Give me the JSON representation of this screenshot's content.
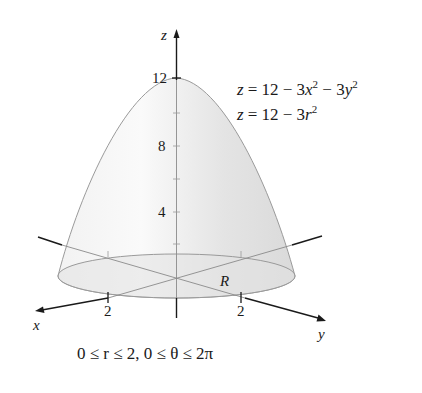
{
  "figure": {
    "equations": {
      "cartesian": {
        "lhs": "z",
        "rhs_prefix": "= 12 − 3",
        "x_var": "x",
        "mid": " − 3",
        "y_var": "y",
        "exp": "2"
      },
      "polar": {
        "lhs": "z",
        "rhs_prefix": "= 12 − 3",
        "r_var": "r",
        "exp": "2"
      }
    },
    "axes": {
      "z_label": "z",
      "x_label": "x",
      "y_label": "y",
      "z_ticks": [
        "12",
        "8",
        "4"
      ],
      "x_tick": "2",
      "y_tick": "2"
    },
    "region_label": "R",
    "domain_caption": "0 ≤ r ≤ 2, 0 ≤ θ ≤ 2π",
    "colors": {
      "surface_fill": "#e9e9e9",
      "surface_stroke": "#9a9a9a",
      "axis": "#1a1a1a",
      "hidden_axis": "#8a8a8a"
    }
  }
}
